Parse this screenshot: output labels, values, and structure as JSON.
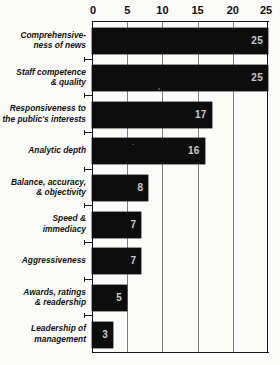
{
  "chart_data": {
    "type": "bar",
    "orientation": "horizontal",
    "title": "",
    "xlabel": "",
    "ylabel": "",
    "xlim": [
      0,
      25
    ],
    "xticks": [
      0,
      5,
      10,
      15,
      20,
      25
    ],
    "grid": true,
    "legend": false,
    "value_labels": true,
    "categories": [
      "Comprehensive-\nness of news",
      "Staff competence\n& quality",
      "Responsiveness to\nthe public's interests",
      "Analytic depth",
      "Balance, accuracy,\n& objectivity",
      "Speed &\nimmediacy",
      "Aggressiveness",
      "Awards, ratings\n& readership",
      "Leadership of\nmanagement"
    ],
    "values": [
      25,
      25,
      17,
      16,
      8,
      7,
      7,
      5,
      3
    ]
  },
  "axis": {
    "tick_labels": [
      "0",
      "5",
      "10",
      "15",
      "20",
      "25"
    ]
  },
  "rows": [
    {
      "label_line1": "Comprehensive-",
      "label_line2": "ness of news",
      "value": 25,
      "value_text": "25"
    },
    {
      "label_line1": "Staff competence",
      "label_line2": "& quality",
      "value": 25,
      "value_text": "25"
    },
    {
      "label_line1": "Responsiveness to",
      "label_line2": "the public's interests",
      "value": 17,
      "value_text": "17"
    },
    {
      "label_line1": "Analytic depth",
      "label_line2": "",
      "value": 16,
      "value_text": "16"
    },
    {
      "label_line1": "Balance, accuracy,",
      "label_line2": "& objectivity",
      "value": 8,
      "value_text": "8"
    },
    {
      "label_line1": "Speed &",
      "label_line2": "immediacy",
      "value": 7,
      "value_text": "7"
    },
    {
      "label_line1": "Aggressiveness",
      "label_line2": "",
      "value": 7,
      "value_text": "7"
    },
    {
      "label_line1": "Awards, ratings",
      "label_line2": "& readership",
      "value": 5,
      "value_text": "5"
    },
    {
      "label_line1": "Leadership of",
      "label_line2": "management",
      "value": 3,
      "value_text": "3"
    }
  ],
  "colors": {
    "bar": "#0d0d0d",
    "value_label": "#c9c9c9",
    "grid": "#7d7d7d",
    "axis": "#141414",
    "background": "#fbfbf9"
  }
}
